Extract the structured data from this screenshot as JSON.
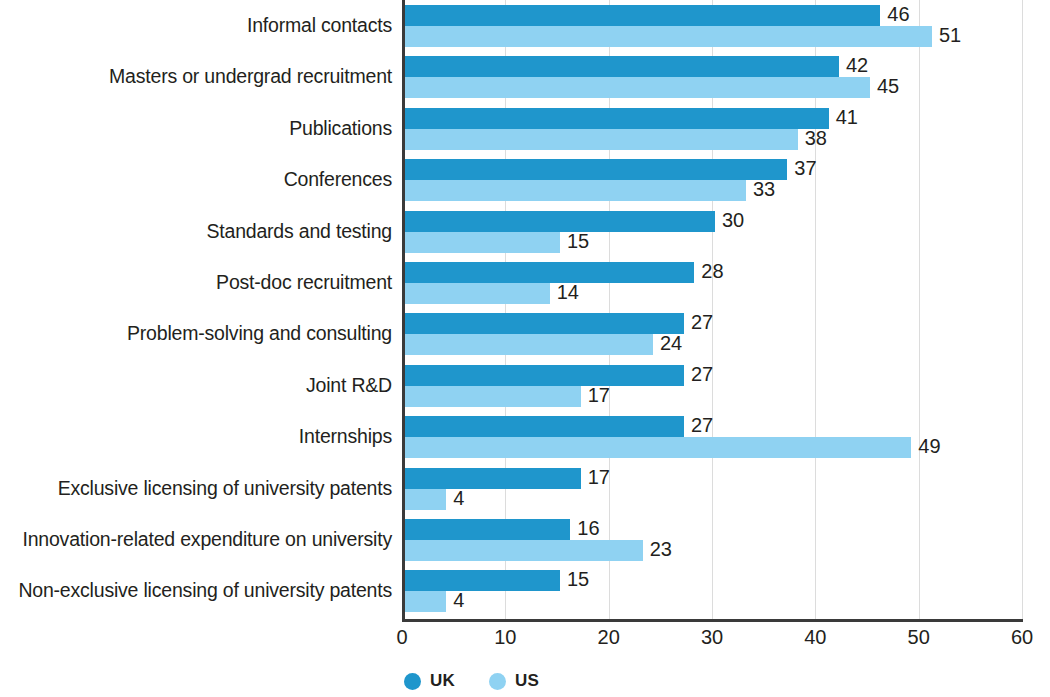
{
  "chart_data": {
    "type": "bar",
    "orientation": "horizontal",
    "title": "",
    "subtitle": "",
    "xlabel": "",
    "ylabel": "",
    "xlim": [
      0,
      60
    ],
    "xticks": [
      0,
      10,
      20,
      30,
      40,
      50,
      60
    ],
    "grid": true,
    "legend_position": "bottom-left",
    "categories": [
      "Informal contacts",
      "Masters or undergrad recruitment",
      "Publications",
      "Conferences",
      "Standards and testing",
      "Post-doc recruitment",
      "Problem-solving and consulting",
      "Joint R&D",
      "Internships",
      "Exclusive licensing of university patents",
      "Innovation-related expenditure on university",
      "Non-exclusive licensing of university patents"
    ],
    "series": [
      {
        "name": "UK",
        "color": "#1f96cc",
        "values": [
          46,
          42,
          41,
          37,
          30,
          28,
          27,
          27,
          27,
          17,
          16,
          15
        ]
      },
      {
        "name": "US",
        "color": "#8fd2f2",
        "values": [
          51,
          45,
          38,
          33,
          15,
          14,
          24,
          17,
          49,
          4,
          23,
          4
        ]
      }
    ]
  },
  "legend": {
    "items": [
      {
        "label": "UK",
        "color": "#1f96cc"
      },
      {
        "label": "US",
        "color": "#8fd2f2"
      }
    ]
  }
}
